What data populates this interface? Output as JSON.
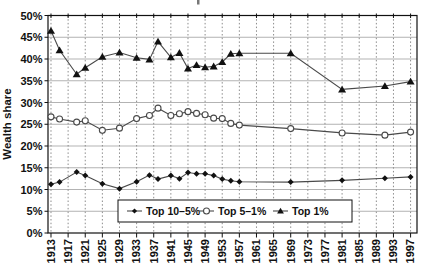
{
  "chart_data": {
    "type": "line",
    "title": "",
    "xlabel": "",
    "ylabel": "Wealth share",
    "ylim": [
      0,
      50
    ],
    "ytick_step": 5,
    "ytick_labels": [
      "0%",
      "5%",
      "10%",
      "15%",
      "20%",
      "25%",
      "30%",
      "35%",
      "40%",
      "45%",
      "50%"
    ],
    "xticks": [
      1913,
      1917,
      1921,
      1925,
      1929,
      1933,
      1937,
      1941,
      1945,
      1949,
      1953,
      1957,
      1961,
      1965,
      1969,
      1973,
      1977,
      1981,
      1985,
      1989,
      1993,
      1997
    ],
    "xtick_labels": [
      "1913",
      "1917",
      "1921",
      "1925",
      "1929",
      "1933",
      "1937",
      "1941",
      "1945",
      "1949",
      "1953",
      "1957",
      "1961",
      "1965",
      "1969",
      "1973",
      "1977",
      "1981",
      "1985",
      "1989",
      "1993",
      "1997"
    ],
    "grid": {
      "horizontal": "solid-gray",
      "vertical": "dashed-gray"
    },
    "legend_position": "inside-bottom-center",
    "x": [
      1913,
      1915,
      1919,
      1921,
      1925,
      1929,
      1933,
      1936,
      1938,
      1941,
      1943,
      1945,
      1947,
      1949,
      1951,
      1953,
      1955,
      1957,
      1969,
      1981,
      1991,
      1997
    ],
    "series": [
      {
        "name": "Top 10–5%",
        "marker": "filled-diamond",
        "color": "#111111",
        "line_color": "#4a4a4a",
        "values": [
          11.2,
          11.7,
          14.0,
          13.2,
          11.3,
          10.2,
          11.8,
          13.3,
          12.4,
          13.2,
          12.5,
          13.9,
          13.6,
          13.6,
          13.2,
          12.4,
          12.0,
          11.8,
          11.7,
          12.1,
          12.6,
          12.9
        ]
      },
      {
        "name": "Top 5–1%",
        "marker": "open-circle",
        "color": "#ffffff",
        "line_color": "#4a4a4a",
        "values": [
          26.7,
          26.2,
          25.5,
          25.8,
          23.6,
          24.1,
          26.3,
          27.0,
          28.7,
          27.0,
          27.4,
          27.9,
          27.5,
          27.2,
          26.4,
          26.3,
          25.2,
          24.8,
          24.0,
          23.0,
          22.5,
          23.2
        ]
      },
      {
        "name": "Top 1%",
        "marker": "filled-triangle",
        "color": "#111111",
        "line_color": "#4a4a4a",
        "values": [
          46.5,
          42.0,
          36.5,
          38.0,
          40.5,
          41.5,
          40.3,
          39.9,
          44.0,
          40.4,
          41.4,
          37.8,
          38.6,
          38.1,
          38.3,
          39.3,
          41.2,
          41.3,
          41.3,
          33.0,
          33.8,
          34.8
        ]
      }
    ]
  }
}
